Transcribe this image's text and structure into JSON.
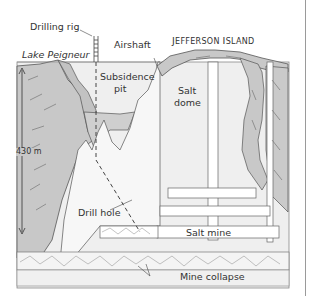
{
  "diagram": {
    "labels": {
      "drilling_rig": "Drilling rig",
      "lake": "Lake Peigneur",
      "airshaft": "Airshaft",
      "island_first": "J",
      "island_first_rest": "EFFERSON ",
      "island_second": "I",
      "island_second_rest": "SLAND",
      "subsidence_pit": "Subsidence",
      "subsidence_pit_2": "pit",
      "salt_dome": "Salt",
      "salt_dome_2": "dome",
      "depth": "430 m",
      "drill_hole": "Drill hole",
      "salt_mine": "Salt mine",
      "mine_collapse": "Mine collapse"
    },
    "colors": {
      "sediment": "#c8c8c8",
      "salt": "#f2f2f2",
      "water": "#e6e6e6",
      "lines": "#555555",
      "border": "#9a9a9a"
    }
  }
}
